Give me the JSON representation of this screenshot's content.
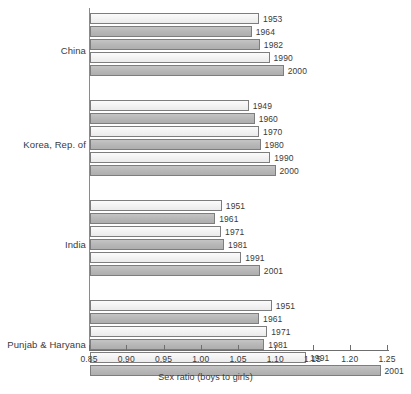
{
  "chart_data": {
    "type": "bar",
    "orientation": "horizontal",
    "title": "",
    "xlabel": "Sex ratio (boys to girls)",
    "ylabel": "",
    "xlim": [
      0.85,
      1.25
    ],
    "xticks": [
      "0.85",
      "0.90",
      "0.95",
      "1.00",
      "1.05",
      "1.10",
      "1.15",
      "1.20",
      "1.25"
    ],
    "xtick_values": [
      0.85,
      0.9,
      0.95,
      1.0,
      1.05,
      1.1,
      1.15,
      1.2,
      1.25
    ],
    "grid": false,
    "legend": "none",
    "categories": [
      "China",
      "Korea, Rep. of",
      "India",
      "Punjab & Haryana"
    ],
    "groups": [
      {
        "name": "China",
        "bars": [
          {
            "label": "1953",
            "value": 1.077,
            "shade": "light"
          },
          {
            "label": "1964",
            "value": 1.067,
            "shade": "dark"
          },
          {
            "label": "1982",
            "value": 1.078,
            "shade": "dark"
          },
          {
            "label": "1990",
            "value": 1.091,
            "shade": "light"
          },
          {
            "label": "2000",
            "value": 1.11,
            "shade": "dark"
          }
        ]
      },
      {
        "name": "Korea, Rep. of",
        "bars": [
          {
            "label": "1949",
            "value": 1.063,
            "shade": "light"
          },
          {
            "label": "1960",
            "value": 1.071,
            "shade": "dark"
          },
          {
            "label": "1970",
            "value": 1.077,
            "shade": "light"
          },
          {
            "label": "1980",
            "value": 1.079,
            "shade": "dark"
          },
          {
            "label": "1990",
            "value": 1.092,
            "shade": "light"
          },
          {
            "label": "2000",
            "value": 1.099,
            "shade": "dark"
          }
        ]
      },
      {
        "name": "India",
        "bars": [
          {
            "label": "1951",
            "value": 1.027,
            "shade": "light"
          },
          {
            "label": "1961",
            "value": 1.018,
            "shade": "dark"
          },
          {
            "label": "1971",
            "value": 1.026,
            "shade": "light"
          },
          {
            "label": "1981",
            "value": 1.03,
            "shade": "dark"
          },
          {
            "label": "1991",
            "value": 1.053,
            "shade": "light"
          },
          {
            "label": "2001",
            "value": 1.078,
            "shade": "dark"
          }
        ]
      },
      {
        "name": "Punjab & Haryana",
        "bars": [
          {
            "label": "1951",
            "value": 1.094,
            "shade": "light"
          },
          {
            "label": "1961",
            "value": 1.077,
            "shade": "dark"
          },
          {
            "label": "1971",
            "value": 1.088,
            "shade": "light"
          },
          {
            "label": "1981",
            "value": 1.084,
            "shade": "dark"
          },
          {
            "label": "1991",
            "value": 1.14,
            "shade": "light"
          },
          {
            "label": "2001",
            "value": 1.24,
            "shade": "dark"
          }
        ]
      }
    ],
    "colors": {
      "bar_light": "#f2f2f2",
      "bar_dark": "#b6b6b6",
      "bar_border": "#7d7d7d",
      "axis": "#6e6e6e",
      "text": "#3a3a3a",
      "background": "#ffffff"
    }
  }
}
